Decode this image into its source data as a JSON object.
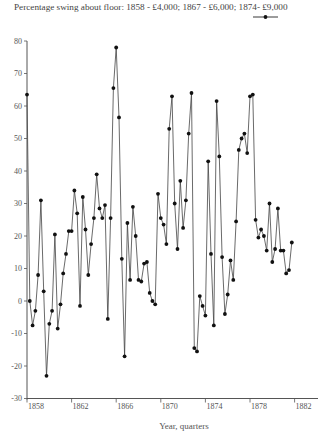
{
  "chart_data": {
    "type": "line",
    "title": "Percentage swing about floor: 1858 - £4,000; 1867 - £6,000; 1874- £9,000",
    "xlabel": "Year, quarters",
    "ylabel": "",
    "ylim": [
      -30,
      80
    ],
    "yticks": [
      -30,
      -20,
      -10,
      0,
      10,
      20,
      30,
      40,
      50,
      60,
      70,
      80
    ],
    "xticks": [
      "1858",
      "1862",
      "1866",
      "1870",
      "1874",
      "1878",
      "1882"
    ],
    "xlim": [
      1858,
      1883.2
    ],
    "grid": false,
    "legend": {
      "position": "top-right",
      "entries": [
        ""
      ]
    },
    "series": [
      {
        "name": "",
        "x_start": 1858,
        "step": 0.25,
        "values": [
          63.5,
          0,
          -7.5,
          -3,
          8,
          31,
          3,
          -23,
          -7,
          -3,
          20.5,
          -8.5,
          -1,
          8.5,
          14.5,
          21.5,
          21.5,
          34,
          27,
          -1.5,
          32,
          22,
          8,
          17.5,
          25.5,
          39,
          28.5,
          25.5,
          29.5,
          -5.5,
          25.5,
          65.5,
          78,
          56.5,
          13,
          -17,
          24,
          6.5,
          29,
          20,
          6.5,
          6,
          11.5,
          12,
          2.5,
          0,
          -1,
          33,
          25.5,
          23.5,
          17.5,
          53,
          63,
          30,
          16,
          37,
          22.5,
          31,
          51.5,
          64,
          -14.5,
          -15.5,
          1.5,
          -1.5,
          -4.5,
          43,
          14.5,
          -7.5,
          61.5,
          44.5,
          13.5,
          -4,
          2,
          12.5,
          6.5,
          24.5,
          46.5,
          50,
          51.5,
          45.5,
          63,
          63.5,
          25,
          19.5,
          22,
          20,
          15.5,
          30,
          12,
          16,
          28.5,
          15.5,
          15.5,
          8.5,
          9.5,
          18
        ]
      }
    ]
  },
  "axes": {
    "y_tick_labels": [
      "-30",
      "-20",
      "-10",
      "0",
      "10",
      "20",
      "30",
      "40",
      "50",
      "60",
      "70",
      "80"
    ],
    "x_tick_labels": [
      "1858",
      "1862",
      "1866",
      "1870",
      "1874",
      "1878",
      "1882"
    ]
  }
}
